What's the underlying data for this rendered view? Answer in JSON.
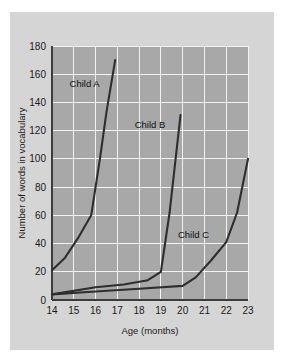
{
  "chart_data": {
    "type": "line",
    "title": "",
    "xlabel": "Age (months)",
    "ylabel": "Number of words in vocabulary",
    "xlim": [
      14,
      23
    ],
    "ylim": [
      0,
      180
    ],
    "grid": true,
    "legend_position": "inline-annotations",
    "x_ticks": [
      14,
      15,
      16,
      17,
      18,
      19,
      20,
      21,
      22,
      23
    ],
    "x_tick_labels": [
      "14",
      "15",
      "16",
      "17",
      "18",
      "19",
      "20",
      "21",
      "22",
      "23"
    ],
    "y_ticks": [
      0,
      20,
      40,
      60,
      80,
      100,
      120,
      140,
      160,
      180
    ],
    "y_tick_labels": [
      "0",
      "20",
      "40",
      "60",
      "80",
      "100",
      "120",
      "140",
      "160",
      "180"
    ],
    "series": [
      {
        "name": "Child A",
        "label_position": {
          "x": 15.5,
          "y": 151
        },
        "x": [
          14.0,
          14.6,
          15.2,
          15.8,
          16.2,
          16.5,
          16.9
        ],
        "values": [
          21,
          30,
          44,
          60,
          100,
          133,
          170
        ]
      },
      {
        "name": "Child B",
        "label_position": {
          "x": 18.5,
          "y": 122
        },
        "x": [
          14.0,
          16.0,
          17.3,
          18.4,
          19.0,
          19.4,
          19.9
        ],
        "values": [
          4,
          9,
          11,
          14,
          20,
          62,
          131
        ]
      },
      {
        "name": "Child C",
        "label_position": {
          "x": 20.5,
          "y": 44
        },
        "x": [
          14.0,
          16.0,
          18.0,
          20.0,
          20.6,
          21.3,
          22.0,
          22.5,
          23.0
        ],
        "values": [
          4,
          6,
          8,
          10,
          16,
          28,
          41,
          62,
          100
        ]
      }
    ]
  },
  "colors": {
    "page_background": "#ffffff",
    "card_background": "#d5d5d5",
    "plot_background": "#a8a8a8",
    "gridline": "#f2f2f2",
    "axis": "#3c3c3c",
    "series_stroke": "#2e2e2e",
    "text": "#1a1a1a"
  }
}
